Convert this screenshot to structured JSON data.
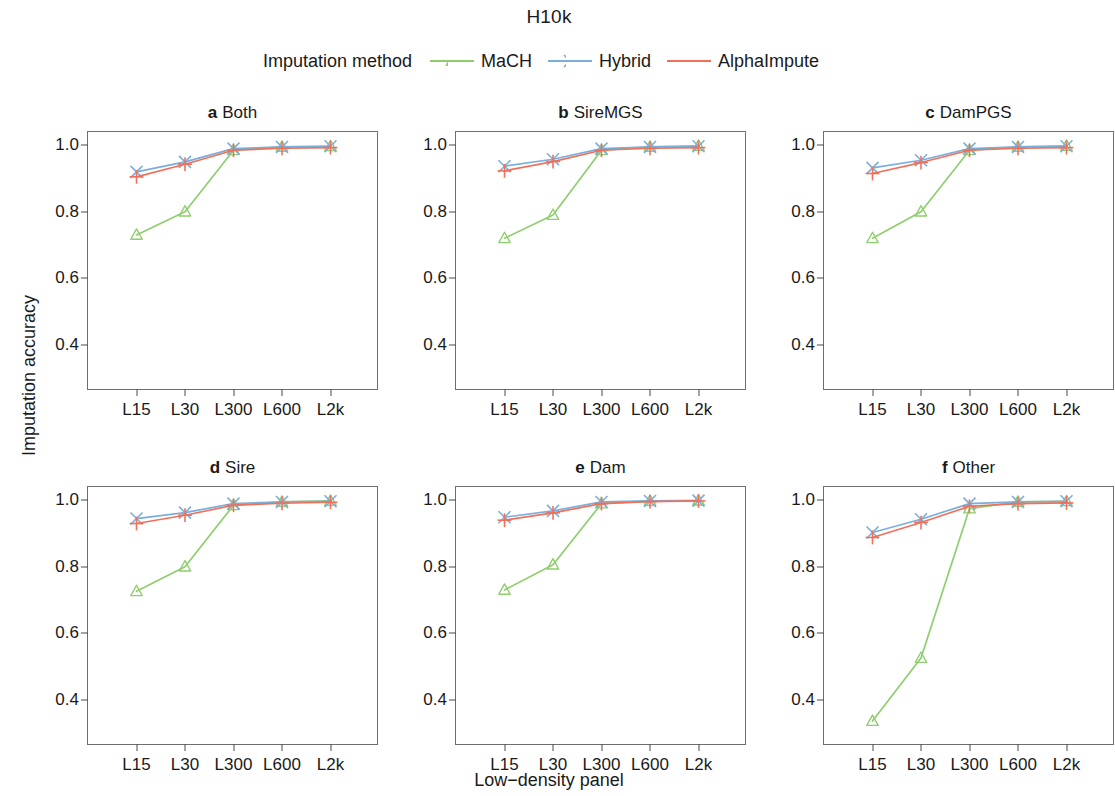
{
  "figure": {
    "title": "H10k",
    "ylabel": "Imputation accuracy",
    "xlabel": "Low−density panel",
    "legend_title": "Imputation method"
  },
  "colors": {
    "mach": "#8fce6e",
    "hybrid": "#7aaedc",
    "alphaimpute": "#f0705a",
    "axis": "#4b4b4b",
    "frame": "#6e6e6e",
    "text": "#1a1a1a"
  },
  "axis": {
    "yticks": [
      "1.0",
      "0.8",
      "0.6",
      "0.4"
    ],
    "ytick_values": [
      1.0,
      0.8,
      0.6,
      0.4
    ],
    "xticks": [
      "L15",
      "L30",
      "L300",
      "L600",
      "L2k"
    ],
    "ylim": [
      0.26,
      1.04
    ],
    "xlim": [
      0,
      6
    ]
  },
  "panels": [
    {
      "tag": "a",
      "name": "Both"
    },
    {
      "tag": "b",
      "name": "SireMGS"
    },
    {
      "tag": "c",
      "name": "DamPGS"
    },
    {
      "tag": "d",
      "name": "Sire"
    },
    {
      "tag": "e",
      "name": "Dam"
    },
    {
      "tag": "f",
      "name": "Other"
    }
  ],
  "legend_items": [
    {
      "label": "MaCH",
      "marker": "triangle-marker",
      "color_key": "mach"
    },
    {
      "label": "Hybrid",
      "marker": "cross-x-marker",
      "color_key": "hybrid"
    },
    {
      "label": "AlphaImpute",
      "marker": "plus-marker",
      "color_key": "alphaimpute"
    }
  ],
  "chart_data": {
    "type": "line",
    "title": "H10k",
    "xlabel": "Low−density panel",
    "ylabel": "Imputation accuracy",
    "legend_title": "Imputation method",
    "legend_position": "top-center",
    "grid": false,
    "x": [
      "L15",
      "L30",
      "L300",
      "L600",
      "L2k"
    ],
    "ylim": [
      0.26,
      1.04
    ],
    "yticks": [
      0.4,
      0.6,
      0.8,
      1.0
    ],
    "panel_layout": "2 rows x 3 columns",
    "panels": [
      {
        "tag": "a",
        "name": "Both",
        "series": [
          {
            "name": "MaCH",
            "values": [
              0.73,
              0.8,
              0.985,
              0.995,
              0.997
            ]
          },
          {
            "name": "Hybrid",
            "values": [
              0.92,
              0.95,
              0.99,
              0.995,
              0.997
            ]
          },
          {
            "name": "AlphaImpute",
            "values": [
              0.905,
              0.943,
              0.985,
              0.991,
              0.993
            ]
          }
        ]
      },
      {
        "tag": "b",
        "name": "SireMGS",
        "series": [
          {
            "name": "MaCH",
            "values": [
              0.72,
              0.79,
              0.985,
              0.995,
              0.998
            ]
          },
          {
            "name": "Hybrid",
            "values": [
              0.937,
              0.958,
              0.99,
              0.995,
              0.997
            ]
          },
          {
            "name": "AlphaImpute",
            "values": [
              0.923,
              0.951,
              0.985,
              0.991,
              0.993
            ]
          }
        ]
      },
      {
        "tag": "c",
        "name": "DamPGS",
        "series": [
          {
            "name": "MaCH",
            "values": [
              0.72,
              0.8,
              0.985,
              0.995,
              0.998
            ]
          },
          {
            "name": "Hybrid",
            "values": [
              0.932,
              0.955,
              0.99,
              0.995,
              0.997
            ]
          },
          {
            "name": "AlphaImpute",
            "values": [
              0.915,
              0.948,
              0.985,
              0.991,
              0.993
            ]
          }
        ]
      },
      {
        "tag": "d",
        "name": "Sire",
        "series": [
          {
            "name": "MaCH",
            "values": [
              0.726,
              0.8,
              0.985,
              0.995,
              0.998
            ]
          },
          {
            "name": "Hybrid",
            "values": [
              0.945,
              0.963,
              0.99,
              0.995,
              0.997
            ]
          },
          {
            "name": "AlphaImpute",
            "values": [
              0.93,
              0.955,
              0.985,
              0.991,
              0.994
            ]
          }
        ]
      },
      {
        "tag": "e",
        "name": "Dam",
        "series": [
          {
            "name": "MaCH",
            "values": [
              0.73,
              0.806,
              0.99,
              0.998,
              0.999
            ]
          },
          {
            "name": "Hybrid",
            "values": [
              0.949,
              0.968,
              0.995,
              0.998,
              0.999
            ]
          },
          {
            "name": "AlphaImpute",
            "values": [
              0.94,
              0.962,
              0.99,
              0.996,
              0.998
            ]
          }
        ]
      },
      {
        "tag": "f",
        "name": "Other",
        "series": [
          {
            "name": "MaCH",
            "values": [
              0.335,
              0.525,
              0.975,
              0.995,
              0.997
            ]
          },
          {
            "name": "Hybrid",
            "values": [
              0.903,
              0.943,
              0.99,
              0.995,
              0.997
            ]
          },
          {
            "name": "AlphaImpute",
            "values": [
              0.888,
              0.933,
              0.982,
              0.99,
              0.992
            ]
          }
        ]
      }
    ]
  }
}
